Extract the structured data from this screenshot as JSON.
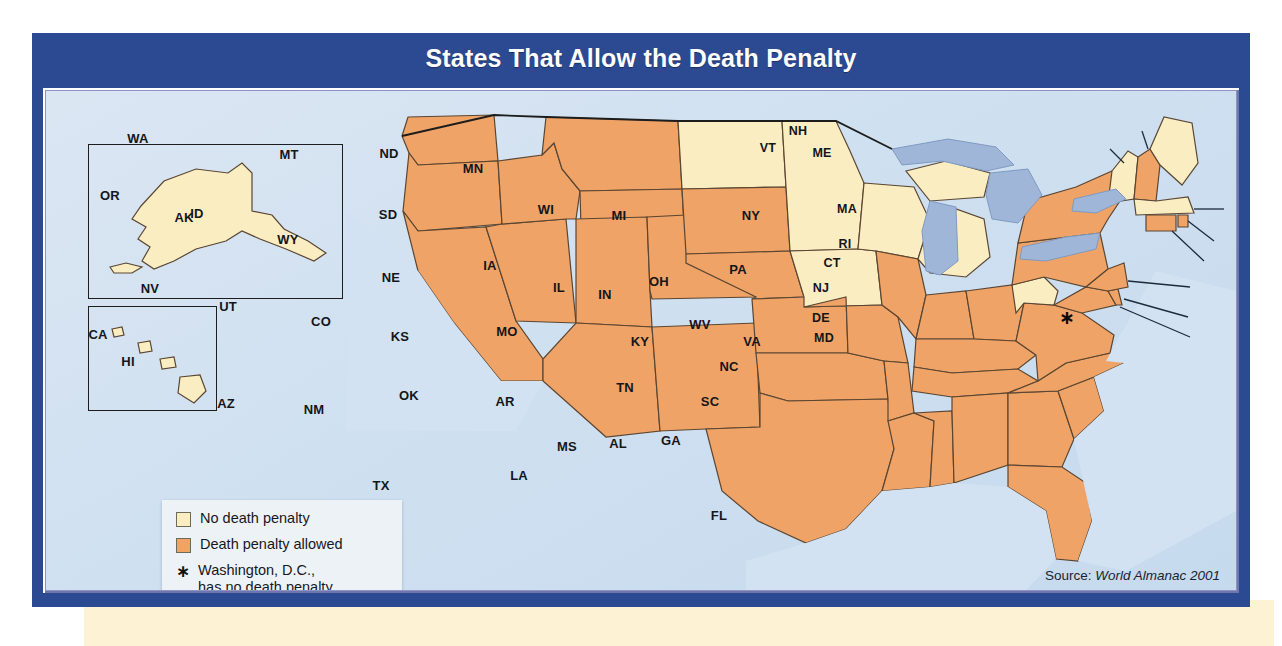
{
  "figure": {
    "title": "States That Allow the Death Penalty",
    "source_prefix": "Source: ",
    "source_work": "World Almanac 2001"
  },
  "colors": {
    "frame_blue": "#2c4a92",
    "title_text": "#ffffff",
    "no_penalty": "#fbedc2",
    "penalty_allowed": "#f0a366",
    "water": "#9fb6d8",
    "ocean": "#d3e2f2",
    "state_border": "#5a4632",
    "country_border": "#1d1d1d",
    "paper_strip": "#fdf3d4"
  },
  "legend": {
    "items": [
      {
        "swatch": "none",
        "label": "No death penalty"
      },
      {
        "swatch": "allow",
        "label": "Death penalty allowed"
      }
    ],
    "footnote_marker": "∗",
    "footnote_line1": "Washington, D.C.,",
    "footnote_line2": "has no death penalty."
  },
  "insets": {
    "alaska": {
      "label": "AK",
      "status": "none"
    },
    "hawaii": {
      "label": "HI",
      "status": "none"
    }
  },
  "dc_marker": {
    "label": "∗",
    "name": "Washington, D.C."
  },
  "map_data": {
    "type": "choropleth",
    "region": "United States",
    "categories": [
      "No death penalty",
      "Death penalty allowed"
    ],
    "states": [
      {
        "code": "WA",
        "status": "allow",
        "x": 92,
        "y": 47
      },
      {
        "code": "OR",
        "status": "allow",
        "x": 64,
        "y": 104
      },
      {
        "code": "ID",
        "status": "allow",
        "x": 151,
        "y": 122
      },
      {
        "code": "MT",
        "status": "allow",
        "x": 243,
        "y": 63
      },
      {
        "code": "WY",
        "status": "allow",
        "x": 242,
        "y": 148
      },
      {
        "code": "NV",
        "status": "allow",
        "x": 104,
        "y": 197
      },
      {
        "code": "UT",
        "status": "allow",
        "x": 182,
        "y": 215
      },
      {
        "code": "CA",
        "status": "allow",
        "x": 52,
        "y": 243
      },
      {
        "code": "AZ",
        "status": "allow",
        "x": 180,
        "y": 312
      },
      {
        "code": "NM",
        "status": "allow",
        "x": 268,
        "y": 318
      },
      {
        "code": "CO",
        "status": "allow",
        "x": 275,
        "y": 230
      },
      {
        "code": "ND",
        "status": "none",
        "x": 343,
        "y": 62
      },
      {
        "code": "SD",
        "status": "allow",
        "x": 342,
        "y": 123
      },
      {
        "code": "NE",
        "status": "allow",
        "x": 345,
        "y": 186
      },
      {
        "code": "KS",
        "status": "allow",
        "x": 354,
        "y": 245
      },
      {
        "code": "OK",
        "status": "allow",
        "x": 363,
        "y": 304
      },
      {
        "code": "TX",
        "status": "allow",
        "x": 335,
        "y": 394
      },
      {
        "code": "MN",
        "status": "none",
        "x": 427,
        "y": 77
      },
      {
        "code": "IA",
        "status": "none",
        "x": 444,
        "y": 174
      },
      {
        "code": "MO",
        "status": "allow",
        "x": 461,
        "y": 240
      },
      {
        "code": "AR",
        "status": "allow",
        "x": 459,
        "y": 310
      },
      {
        "code": "LA",
        "status": "allow",
        "x": 473,
        "y": 384
      },
      {
        "code": "WI",
        "status": "none",
        "x": 500,
        "y": 118
      },
      {
        "code": "IL",
        "status": "allow",
        "x": 513,
        "y": 196
      },
      {
        "code": "MS",
        "status": "allow",
        "x": 521,
        "y": 355
      },
      {
        "code": "MI",
        "status": "none",
        "x": 573,
        "y": 124
      },
      {
        "code": "IN",
        "status": "allow",
        "x": 559,
        "y": 203
      },
      {
        "code": "KY",
        "status": "allow",
        "x": 594,
        "y": 250
      },
      {
        "code": "TN",
        "status": "allow",
        "x": 579,
        "y": 296
      },
      {
        "code": "AL",
        "status": "allow",
        "x": 572,
        "y": 352
      },
      {
        "code": "OH",
        "status": "allow",
        "x": 613,
        "y": 190
      },
      {
        "code": "GA",
        "status": "allow",
        "x": 625,
        "y": 349
      },
      {
        "code": "FL",
        "status": "allow",
        "x": 673,
        "y": 424
      },
      {
        "code": "SC",
        "status": "allow",
        "x": 664,
        "y": 310
      },
      {
        "code": "NC",
        "status": "allow",
        "x": 683,
        "y": 275
      },
      {
        "code": "WV",
        "status": "none",
        "x": 654,
        "y": 233
      },
      {
        "code": "VA",
        "status": "allow",
        "x": 706,
        "y": 250
      },
      {
        "code": "PA",
        "status": "allow",
        "x": 692,
        "y": 178
      },
      {
        "code": "NY",
        "status": "allow",
        "x": 705,
        "y": 124
      },
      {
        "code": "ME",
        "status": "none",
        "x": 776,
        "y": 62
      },
      {
        "code": "VT",
        "status": "none",
        "x": 722,
        "y": 57
      },
      {
        "code": "NH",
        "status": "allow",
        "x": 752,
        "y": 40
      },
      {
        "code": "MA",
        "status": "none",
        "x": 801,
        "y": 118
      },
      {
        "code": "RI",
        "status": "allow",
        "x": 799,
        "y": 153
      },
      {
        "code": "CT",
        "status": "allow",
        "x": 786,
        "y": 172
      },
      {
        "code": "NJ",
        "status": "allow",
        "x": 775,
        "y": 197
      },
      {
        "code": "DE",
        "status": "allow",
        "x": 775,
        "y": 227
      },
      {
        "code": "MD",
        "status": "allow",
        "x": 778,
        "y": 247
      },
      {
        "code": "AK",
        "status": "none",
        "x": 138,
        "y": 126
      },
      {
        "code": "HI",
        "status": "none",
        "x": 82,
        "y": 270
      }
    ],
    "callout_labels": [
      "NH",
      "VT",
      "ME",
      "MA",
      "RI",
      "CT",
      "NJ",
      "DE",
      "MD"
    ],
    "counts": {
      "no_death_penalty": 12,
      "death_penalty_allowed": 38
    }
  }
}
